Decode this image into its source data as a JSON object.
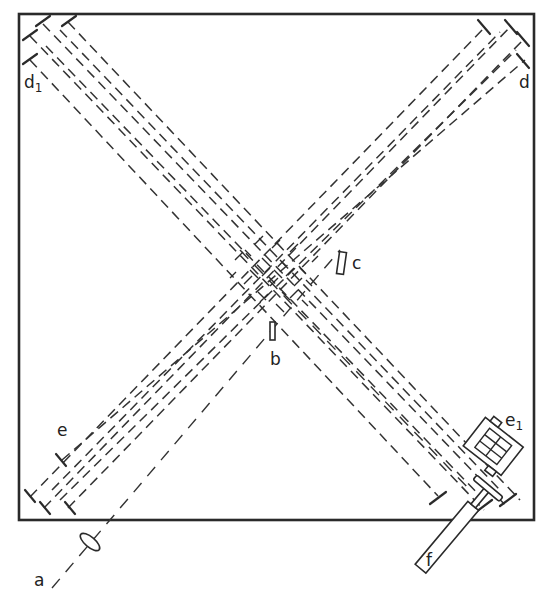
{
  "figure": {
    "type": "optical multipass mirror arrangement",
    "labels": {
      "a": "a",
      "b": "b",
      "c": "c",
      "d": "d",
      "d1": "d",
      "d1_sub": "1",
      "e": "e",
      "e1": "e",
      "e1_sub": "1",
      "f": "f"
    },
    "components": [
      {
        "id": "a",
        "description": "lens (source input)"
      },
      {
        "id": "b",
        "description": "small element at crossing"
      },
      {
        "id": "c",
        "description": "rectangular element"
      },
      {
        "id": "d",
        "description": "mirror bank, upper right"
      },
      {
        "id": "d1",
        "description": "mirror bank, upper left"
      },
      {
        "id": "e",
        "description": "mirror, lower left"
      },
      {
        "id": "e1",
        "description": "detector/camera, lower right"
      },
      {
        "id": "f",
        "description": "telescope/eyepiece, bottom right"
      }
    ],
    "colors": {
      "stroke": "#2a2a2a",
      "background": "#ffffff"
    }
  }
}
